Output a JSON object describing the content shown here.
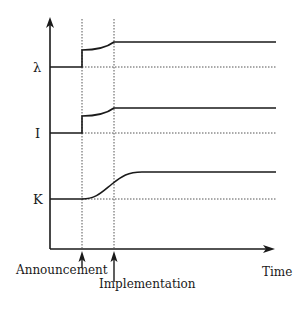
{
  "diagram": {
    "type": "time-path diagram",
    "x_axis_label": "Time",
    "y_labels": {
      "lambda": "λ",
      "investment": "I",
      "capital": "K"
    },
    "events": [
      {
        "name": "announcement",
        "label": "Announcement"
      },
      {
        "name": "implementation",
        "label": "Implementation"
      }
    ],
    "series": [
      {
        "name": "lambda",
        "label": "λ",
        "behavior": "jumps at announcement, rises gradually, reaches new level at implementation"
      },
      {
        "name": "investment",
        "label": "I",
        "behavior": "jumps at announcement, rises gradually, reaches new level at implementation"
      },
      {
        "name": "capital",
        "label": "K",
        "behavior": "smooth S-shaped rise beginning at announcement, levels off after implementation"
      }
    ],
    "colors": {
      "line": "#1a1a1a",
      "dotted": "#555555",
      "background": "#ffffff"
    }
  }
}
